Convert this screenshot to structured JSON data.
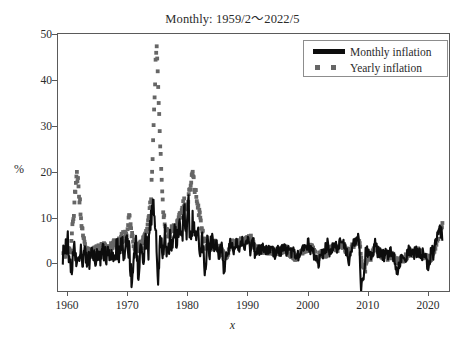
{
  "chart_data": {
    "type": "line",
    "title": "Monthly: 1959/2～2022/5",
    "xlabel": "x",
    "ylabel": "%",
    "xlim": [
      1958.5,
      2023.5
    ],
    "ylim": [
      -6,
      50
    ],
    "xticks": [
      1960,
      1970,
      1980,
      1990,
      2000,
      2010,
      2020
    ],
    "yticks": [
      0,
      10,
      20,
      30,
      40,
      50
    ],
    "grid": false,
    "legend_position": "top-right",
    "series": [
      {
        "name": "Monthly inflation",
        "style": "solid-line",
        "color": "#0d0d0d",
        "note": "Month-over-month annualized inflation rate, high-frequency noise band roughly -5 to +6 percent, peak near 14 percent in 1974",
        "x": [
          1959.1,
          1959.6,
          1960.1,
          1960.4,
          1960.8,
          1961.2,
          1961.5,
          1961.9,
          1962.3,
          1962.7,
          1963.1,
          1963.5,
          1963.9,
          1964.3,
          1964.7,
          1965.1,
          1965.5,
          1965.9,
          1966.3,
          1966.7,
          1967.1,
          1967.5,
          1967.9,
          1968.3,
          1968.7,
          1969.1,
          1969.5,
          1969.9,
          1970.3,
          1970.7,
          1971.1,
          1971.5,
          1971.9,
          1972.3,
          1972.7,
          1973.1,
          1973.5,
          1973.9,
          1974.1,
          1974.3,
          1974.5,
          1974.8,
          1975.1,
          1975.5,
          1975.9,
          1976.3,
          1976.7,
          1977.1,
          1977.5,
          1977.9,
          1978.3,
          1978.7,
          1979.1,
          1979.5,
          1979.9,
          1980.2,
          1980.5,
          1980.9,
          1981.3,
          1981.7,
          1982.1,
          1982.5,
          1982.9,
          1983.3,
          1983.7,
          1984.1,
          1984.5,
          1984.9,
          1985.3,
          1985.7,
          1986.1,
          1986.5,
          1986.9,
          1987.3,
          1987.7,
          1988.1,
          1988.5,
          1988.9,
          1989.3,
          1989.7,
          1990.1,
          1990.5,
          1990.9,
          1991.3,
          1991.7,
          1992.1,
          1992.5,
          1992.9,
          1993.3,
          1993.7,
          1994.1,
          1994.5,
          1994.9,
          1995.3,
          1995.7,
          1996.1,
          1996.5,
          1996.9,
          1997.3,
          1997.7,
          1998.1,
          1998.5,
          1998.9,
          1999.3,
          1999.7,
          2000.1,
          2000.5,
          2000.9,
          2001.3,
          2001.7,
          2002.1,
          2002.5,
          2002.9,
          2003.3,
          2003.7,
          2004.1,
          2004.5,
          2004.9,
          2005.3,
          2005.7,
          2006.1,
          2006.5,
          2006.9,
          2007.3,
          2007.7,
          2008.1,
          2008.5,
          2008.9,
          2009.3,
          2009.7,
          2010.1,
          2010.5,
          2010.9,
          2011.3,
          2011.7,
          2012.1,
          2012.5,
          2012.9,
          2013.3,
          2013.7,
          2014.1,
          2014.5,
          2014.9,
          2015.3,
          2015.7,
          2016.1,
          2016.5,
          2016.9,
          2017.3,
          2017.7,
          2018.1,
          2018.5,
          2018.9,
          2019.3,
          2019.7,
          2020.1,
          2020.5,
          2020.9,
          2021.3,
          2021.7,
          2022.0,
          2022.4
        ],
        "values": [
          1.2,
          2.8,
          5.5,
          0.4,
          -1.5,
          3.2,
          1.0,
          -0.8,
          2.4,
          0.6,
          1.8,
          -0.5,
          2.2,
          1.1,
          0.3,
          2.6,
          1.4,
          3.0,
          1.9,
          2.1,
          0.8,
          2.9,
          1.6,
          3.4,
          2.0,
          4.2,
          2.6,
          5.0,
          3.1,
          -3.5,
          2.2,
          4.6,
          -2.8,
          3.6,
          1.2,
          5.4,
          2.0,
          8.6,
          11.2,
          14.0,
          9.4,
          6.2,
          -4.5,
          4.8,
          2.6,
          6.4,
          1.8,
          5.2,
          3.0,
          6.8,
          4.2,
          9.0,
          5.6,
          11.5,
          7.2,
          13.0,
          4.0,
          9.6,
          6.2,
          8.4,
          3.6,
          5.0,
          -1.2,
          4.4,
          2.8,
          5.6,
          3.2,
          4.0,
          1.8,
          3.6,
          -2.4,
          2.0,
          3.4,
          4.6,
          2.2,
          4.8,
          3.0,
          5.2,
          4.0,
          3.4,
          5.6,
          2.8,
          6.2,
          1.4,
          3.0,
          2.6,
          3.4,
          2.0,
          3.2,
          2.4,
          3.6,
          2.0,
          3.8,
          2.2,
          3.0,
          3.4,
          2.6,
          3.8,
          1.8,
          2.4,
          0.6,
          2.0,
          1.4,
          3.2,
          2.6,
          4.4,
          3.0,
          2.0,
          1.2,
          -0.8,
          2.4,
          1.6,
          3.0,
          4.2,
          1.8,
          3.6,
          4.0,
          3.2,
          4.6,
          5.0,
          4.2,
          2.4,
          -1.0,
          3.6,
          4.4,
          5.2,
          6.0,
          -5.5,
          -2.0,
          3.4,
          2.2,
          1.0,
          3.0,
          4.2,
          2.6,
          2.0,
          1.4,
          2.4,
          1.6,
          2.2,
          1.8,
          1.0,
          -2.6,
          0.4,
          1.8,
          1.2,
          2.2,
          2.6,
          2.0,
          2.4,
          2.8,
          2.2,
          1.4,
          2.6,
          2.0,
          -2.2,
          3.4,
          2.0,
          4.8,
          6.4,
          7.2,
          6.0
        ]
      },
      {
        "name": "Yearly inflation",
        "style": "dotted-markers",
        "color": "#666666",
        "note": "Year-over-year inflation rate, smoother series with peaks of about 20 percent in 1961, 47 percent in 1974, and 21 percent in 1980-1982",
        "x": [
          1959.3,
          1959.8,
          1960.2,
          1960.6,
          1960.9,
          1961.0,
          1961.2,
          1961.4,
          1961.6,
          1961.8,
          1962.2,
          1962.6,
          1963.0,
          1963.5,
          1964.0,
          1964.5,
          1965.0,
          1965.5,
          1966.0,
          1966.5,
          1967.0,
          1967.5,
          1968.0,
          1968.5,
          1969.0,
          1969.5,
          1970.0,
          1970.3,
          1970.6,
          1971.0,
          1971.5,
          1972.0,
          1972.5,
          1973.0,
          1973.4,
          1973.7,
          1974.0,
          1974.15,
          1974.3,
          1974.45,
          1974.6,
          1974.75,
          1974.9,
          1975.1,
          1975.3,
          1975.6,
          1976.0,
          1976.5,
          1977.0,
          1977.5,
          1978.0,
          1978.5,
          1979.0,
          1979.5,
          1980.0,
          1980.3,
          1980.6,
          1980.9,
          1981.2,
          1981.5,
          1981.8,
          1982.0,
          1982.3,
          1982.6,
          1983.0,
          1983.5,
          1984.0,
          1984.5,
          1985.0,
          1985.5,
          1986.0,
          1986.5,
          1987.0,
          1987.5,
          1988.0,
          1988.5,
          1989.0,
          1989.5,
          1990.0,
          1990.5,
          1991.0,
          1991.5,
          1992.0,
          1992.5,
          1993.0,
          1993.5,
          1994.0,
          1994.5,
          1995.0,
          1995.5,
          1996.0,
          1996.5,
          1997.0,
          1997.5,
          1998.0,
          1998.5,
          1999.0,
          1999.5,
          2000.0,
          2000.5,
          2001.0,
          2001.5,
          2002.0,
          2002.5,
          2003.0,
          2003.5,
          2004.0,
          2004.5,
          2005.0,
          2005.5,
          2006.0,
          2006.5,
          2007.0,
          2007.5,
          2008.0,
          2008.5,
          2009.0,
          2009.5,
          2010.0,
          2010.5,
          2011.0,
          2011.5,
          2012.0,
          2012.5,
          2013.0,
          2013.5,
          2014.0,
          2014.5,
          2015.0,
          2015.5,
          2016.0,
          2016.5,
          2017.0,
          2017.5,
          2018.0,
          2018.5,
          2019.0,
          2019.5,
          2020.0,
          2020.5,
          2021.0,
          2021.3,
          2021.6,
          2021.9,
          2022.2,
          2022.4
        ],
        "values": [
          2.0,
          2.6,
          3.4,
          2.8,
          7.6,
          9.8,
          12.0,
          16.5,
          19.4,
          18.0,
          12.2,
          6.0,
          3.2,
          2.6,
          2.0,
          2.4,
          2.8,
          3.2,
          3.6,
          3.4,
          3.0,
          3.8,
          4.2,
          4.6,
          5.4,
          6.0,
          5.8,
          10.4,
          7.2,
          4.4,
          3.8,
          3.4,
          4.0,
          6.2,
          8.8,
          11.0,
          14.5,
          20.5,
          26.0,
          31.0,
          38.0,
          44.0,
          47.0,
          41.0,
          33.0,
          22.0,
          11.0,
          7.0,
          6.4,
          7.2,
          8.0,
          9.4,
          11.6,
          13.4,
          10.8,
          16.6,
          17.5,
          20.0,
          16.0,
          14.5,
          12.0,
          10.5,
          8.6,
          6.2,
          4.0,
          3.4,
          4.2,
          4.4,
          3.8,
          3.2,
          2.0,
          1.6,
          3.6,
          4.4,
          4.0,
          4.6,
          5.0,
          4.8,
          5.4,
          5.8,
          4.2,
          3.0,
          3.2,
          2.8,
          3.0,
          2.6,
          2.8,
          2.4,
          2.6,
          2.8,
          3.2,
          3.0,
          2.2,
          1.8,
          1.4,
          1.6,
          2.2,
          2.8,
          3.4,
          3.8,
          2.6,
          1.4,
          1.8,
          2.4,
          2.0,
          2.8,
          3.2,
          3.6,
          3.4,
          4.2,
          3.8,
          2.6,
          2.4,
          3.8,
          4.6,
          5.4,
          0.4,
          -1.6,
          2.2,
          1.4,
          2.8,
          3.6,
          2.2,
          1.8,
          1.6,
          1.4,
          1.8,
          1.2,
          0.2,
          0.6,
          1.2,
          1.6,
          2.4,
          2.0,
          2.4,
          2.8,
          1.8,
          1.6,
          1.4,
          1.0,
          2.6,
          4.2,
          5.4,
          6.8,
          8.0,
          8.6
        ]
      }
    ]
  },
  "legend": {
    "items": [
      {
        "label": "Monthly inflation",
        "marker": "solid-line"
      },
      {
        "label": "Yearly inflation",
        "marker": "dotted-squares"
      }
    ]
  }
}
